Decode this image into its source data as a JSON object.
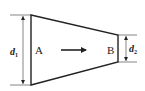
{
  "diagram": {
    "type": "tapered pipe / trapezoid cross-section",
    "labels": {
      "left_point": "A",
      "right_point": "B",
      "left_dimension": "d",
      "left_dimension_sub": "1",
      "right_dimension": "d",
      "right_dimension_sub": "2"
    },
    "flow_direction": "A to B",
    "colors": {
      "stroke": "#222222",
      "background": "#ffffff"
    }
  }
}
